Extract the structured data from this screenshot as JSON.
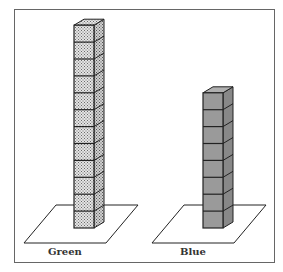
{
  "chart_data": {
    "type": "bar",
    "style": "3d cube towers on square bases",
    "categories": [
      "Green",
      "Blue"
    ],
    "values": [
      12,
      8
    ],
    "unit": "cubes",
    "title": "",
    "xlabel": "",
    "ylabel": ""
  },
  "towers": [
    {
      "label": "Green",
      "cubes": 12,
      "fill": "#d6d6d6",
      "pattern": "dotted"
    },
    {
      "label": "Blue",
      "cubes": 8,
      "fill": "#9a9a9a",
      "pattern": "solid"
    }
  ]
}
